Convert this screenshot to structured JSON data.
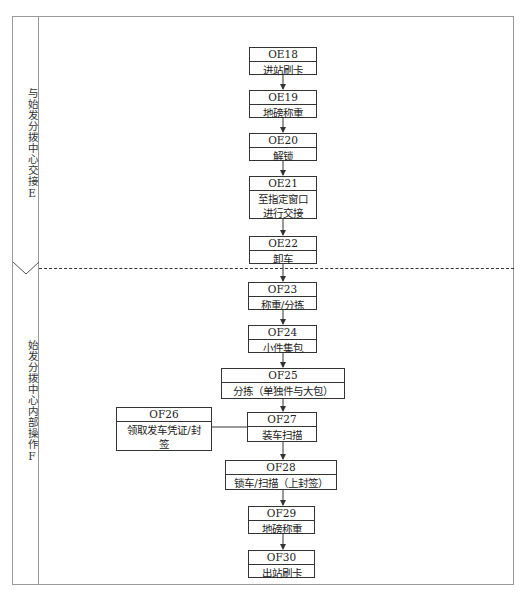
{
  "lanes": [
    {
      "label": "与始发分拨中心交接E",
      "id": "E"
    },
    {
      "label": "始发分拨中心内部操作F",
      "id": "F"
    }
  ],
  "steps": [
    {
      "code": "OE18",
      "label": "进站刷卡"
    },
    {
      "code": "OE19",
      "label": "地磅称重"
    },
    {
      "code": "OE20",
      "label": "解锁"
    },
    {
      "code": "OE21",
      "label": "至指定窗口进行交接"
    },
    {
      "code": "OE22",
      "label": "卸车"
    },
    {
      "code": "OF23",
      "label": "称重/分拣"
    },
    {
      "code": "OF24",
      "label": "小件集包"
    },
    {
      "code": "OF25",
      "label": "分拣（单独件与大包）"
    },
    {
      "code": "OF26",
      "label": "领取发车凭证/封签"
    },
    {
      "code": "OF27",
      "label": "装车扫描"
    },
    {
      "code": "OF28",
      "label": "锁车/扫描（上封签）"
    },
    {
      "code": "OF29",
      "label": "地磅称重"
    },
    {
      "code": "OF30",
      "label": "出站刷卡"
    }
  ]
}
